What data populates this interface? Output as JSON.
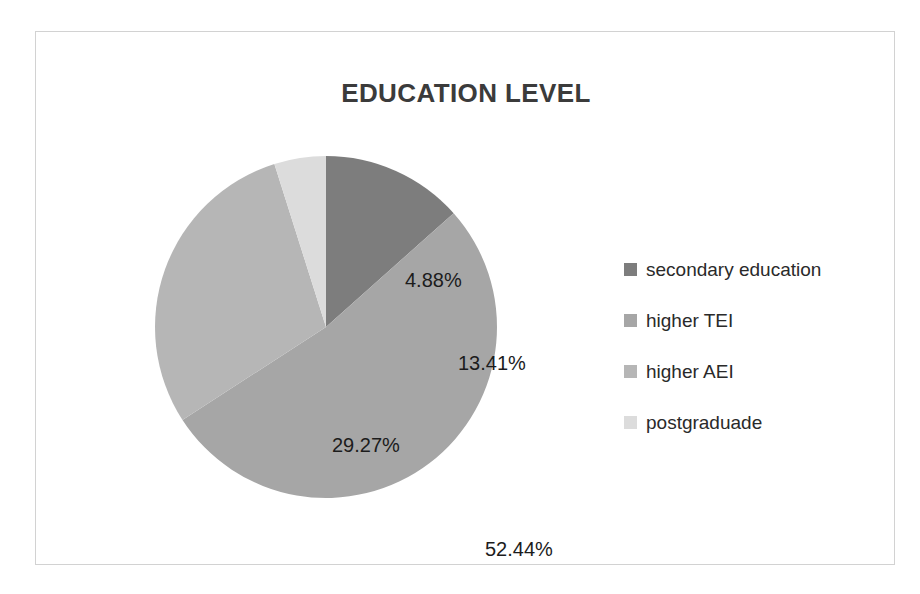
{
  "figure": {
    "title": "EDUCATION LEVEL",
    "background_color": "#ffffff",
    "frame_color": "#d2d2d2",
    "text_color": "#1c1c1c",
    "title_color": "#3b3b3b"
  },
  "chart_data": {
    "type": "pie",
    "title": "EDUCATION LEVEL",
    "xlabel": "",
    "ylabel": "",
    "unit": "%",
    "start_angle_deg": 0,
    "direction": "clockwise",
    "grid": false,
    "legend_position": "right",
    "categories": [
      "secondary education",
      "higher TEI",
      "higher AEI",
      "postgraduade"
    ],
    "values": [
      13.41,
      52.44,
      29.27,
      4.88
    ],
    "data_labels": [
      "13.41%",
      "52.44%",
      "29.27%",
      "4.88%"
    ],
    "colors": [
      "#7d7d7d",
      "#a6a6a6",
      "#b6b6b6",
      "#dcdcdc"
    ],
    "total": 100.0
  },
  "labels": {
    "secondary": "13.41%",
    "tei": "52.44%",
    "aei": "29.27%",
    "postgrad": "4.88%"
  },
  "legend": {
    "items": [
      {
        "label": "secondary education",
        "color": "#7d7d7d"
      },
      {
        "label": "higher TEI",
        "color": "#a6a6a6"
      },
      {
        "label": "higher AEI",
        "color": "#b6b6b6"
      },
      {
        "label": "postgraduade",
        "color": "#dcdcdc"
      }
    ]
  }
}
